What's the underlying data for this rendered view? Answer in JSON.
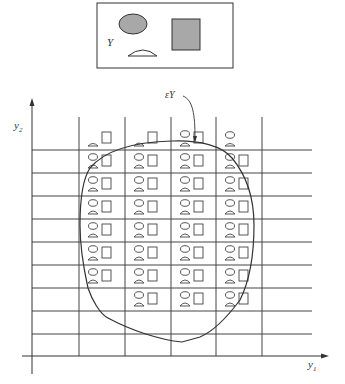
{
  "legend_box": {
    "label": "Y",
    "shapes": [
      "ellipse",
      "square",
      "half-dome"
    ],
    "fill_color": "#a8a8a8"
  },
  "axes": {
    "x_label": "y",
    "x_sub": "1",
    "y_label": "y",
    "y_sub": "2"
  },
  "annotation": {
    "label": "εY"
  },
  "grid": {
    "vertical_lines_x": [
      79,
      125,
      171,
      216,
      262
    ],
    "horizontal_lines_y": [
      150,
      173,
      196,
      219,
      242,
      265,
      288,
      311,
      334
    ]
  },
  "colors": {
    "line": "#333333",
    "grid": "#444444"
  }
}
